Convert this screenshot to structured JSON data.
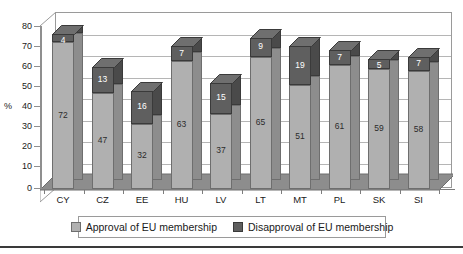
{
  "chart_data": {
    "type": "bar",
    "subtype": "stacked-3d-column",
    "title": "",
    "xlabel": "",
    "ylabel": "%",
    "ylim": [
      0,
      80
    ],
    "ytick_step": 10,
    "yticks": [
      "0",
      "10",
      "20",
      "30",
      "40",
      "50",
      "60",
      "70",
      "80"
    ],
    "grid": true,
    "legend_position": "bottom",
    "categories": [
      "CY",
      "CZ",
      "EE",
      "HU",
      "LV",
      "LT",
      "MT",
      "PL",
      "SK",
      "SI"
    ],
    "series": [
      {
        "name": "Approval of EU membership",
        "color": "#b0b0b0",
        "values": [
          72,
          47,
          32,
          63,
          37,
          65,
          51,
          61,
          59,
          58
        ]
      },
      {
        "name": "Disapproval of EU membership",
        "color": "#5f5f5f",
        "values": [
          4,
          13,
          16,
          7,
          15,
          9,
          19,
          7,
          5,
          7
        ]
      }
    ],
    "totals": [
      76,
      60,
      48,
      70,
      52,
      74,
      70,
      68,
      64,
      65
    ]
  },
  "axis": {
    "y_title": "%",
    "y_labels": [
      "80",
      "70",
      "60",
      "50",
      "40",
      "30",
      "20",
      "10",
      "0"
    ],
    "x_labels": [
      "CY",
      "CZ",
      "EE",
      "HU",
      "LV",
      "LT",
      "MT",
      "PL",
      "SK",
      "SI"
    ]
  },
  "legend": {
    "items": [
      {
        "label": "Approval of EU membership",
        "key": "approve-key",
        "color": "#b0b0b0"
      },
      {
        "label": "Disapproval of EU membership",
        "key": "disapprove-key",
        "color": "#5f5f5f"
      }
    ]
  },
  "values": {
    "approve": [
      "72",
      "47",
      "32",
      "63",
      "37",
      "65",
      "51",
      "61",
      "59",
      "58"
    ],
    "disapprove": [
      "4",
      "13",
      "16",
      "7",
      "15",
      "9",
      "19",
      "7",
      "5",
      "7"
    ]
  }
}
